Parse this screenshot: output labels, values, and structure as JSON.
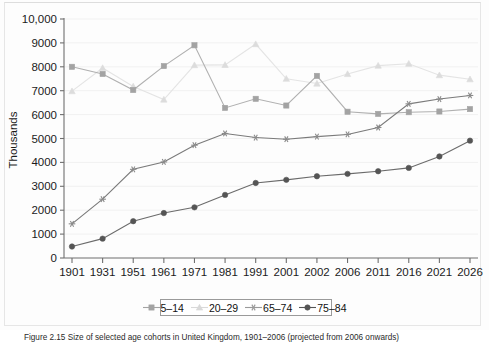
{
  "figure": {
    "caption": "Figure 2.15 Size of selected age cohorts in United Kingdom, 1901–2006 (projected from 2006 onwards)"
  },
  "legend": {
    "position": "bottom-center",
    "entries": [
      {
        "label": "5–14",
        "marker": "square",
        "color": "#a3a3a3"
      },
      {
        "label": "20–29",
        "marker": "triangle",
        "color": "#d9d9d9"
      },
      {
        "label": "65–74",
        "marker": "asterisk",
        "color": "#9a9a9a"
      },
      {
        "label": "75–84",
        "marker": "circle",
        "color": "#555555"
      }
    ]
  },
  "chart_data": {
    "type": "line",
    "title": "",
    "xlabel": "",
    "ylabel": "Thousands",
    "ylim": [
      0,
      10000
    ],
    "yticks": [
      0,
      1000,
      2000,
      3000,
      4000,
      5000,
      6000,
      7000,
      8000,
      9000,
      10000
    ],
    "ytick_labels": [
      "0",
      "1000",
      "2000",
      "3000",
      "4000",
      "5000",
      "6000",
      "7000",
      "8000",
      "9000",
      "10,000"
    ],
    "grid": true,
    "categories": [
      "1901",
      "1931",
      "1951",
      "1961",
      "1971",
      "1981",
      "1991",
      "2001",
      "2002",
      "2006",
      "2011",
      "2016",
      "2021",
      "2026"
    ],
    "series": [
      {
        "name": "5–14",
        "marker": "square",
        "color": "#a3a3a3",
        "line_color": "#b0b0b0",
        "values": [
          8000,
          7700,
          7030,
          8030,
          8900,
          6280,
          6660,
          6380,
          7620,
          6120,
          6030,
          6100,
          6130,
          6230
        ]
      },
      {
        "name": "20–29",
        "marker": "triangle",
        "color": "#dcdcdc",
        "line_color": "#e4e4e4",
        "values": [
          6980,
          7950,
          7180,
          6630,
          8070,
          8080,
          8950,
          7500,
          7300,
          7700,
          8050,
          8130,
          7650,
          7480
        ]
      },
      {
        "name": "65–74",
        "marker": "asterisk",
        "color": "#8a8a8a",
        "line_color": "#7a7a7a",
        "values": [
          1430,
          2460,
          3710,
          4020,
          4720,
          5210,
          5040,
          4970,
          5080,
          5170,
          5460,
          6450,
          6650,
          6800
        ]
      },
      {
        "name": "75–84",
        "marker": "circle",
        "color": "#555555",
        "line_color": "#6b6b6b",
        "values": [
          480,
          810,
          1540,
          1880,
          2120,
          2640,
          3140,
          3270,
          3420,
          3520,
          3630,
          3770,
          4250,
          4910
        ]
      }
    ]
  }
}
